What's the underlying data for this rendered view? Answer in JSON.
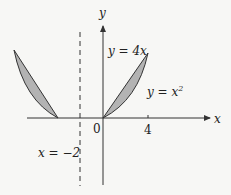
{
  "diagram": {
    "axes": {
      "x_label": "x",
      "y_label": "y",
      "origin_label": "0",
      "x_tick_label": "4"
    },
    "curves": {
      "line_label": "y = 4x",
      "parabola_label_base": "y = x",
      "parabola_label_exp": "2"
    },
    "dashed_line": {
      "label": "x = −2"
    },
    "colors": {
      "shade": "#b3b3b3",
      "stroke": "#333333",
      "background": "#f7f7f5"
    }
  }
}
